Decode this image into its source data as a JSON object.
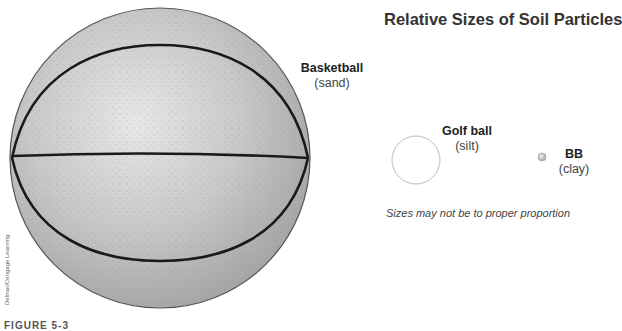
{
  "title": "Relative Sizes of Soil Particles",
  "particles": [
    {
      "name": "Basketball",
      "soil": "(sand)",
      "icon": "basketball-icon"
    },
    {
      "name": "Golf ball",
      "soil": "(silt)",
      "icon": "golf-ball-icon"
    },
    {
      "name": "BB",
      "soil": "(clay)",
      "icon": "bb-pellet-icon"
    }
  ],
  "note": "Sizes may not be to proper proportion",
  "credit": "Delmar/Cengage Learning",
  "caption": "FIGURE 5-3",
  "colors": {
    "ball_fill": "#b4b4b4",
    "ball_highlight": "#e6e6e6",
    "seam": "#1a1a1a",
    "golf_outline": "#bdbdbd",
    "bb_fill": "#c9c9c9"
  }
}
